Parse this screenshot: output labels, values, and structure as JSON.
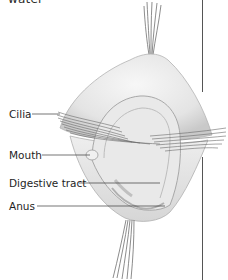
{
  "heading": {
    "text": "water"
  },
  "figure": {
    "colors": {
      "body_fill": "#ececec",
      "body_shade": "#cfcfcf",
      "outline": "#9a9a9a",
      "cilia": "#6e6e6e",
      "leader_line": "#3a3a3a",
      "divider": "#555555",
      "gut_mark": "#b5b5b5"
    }
  },
  "labels": [
    {
      "id": "cilia",
      "text": "Cilia"
    },
    {
      "id": "mouth",
      "text": "Mouth"
    },
    {
      "id": "digestive_tract",
      "text": "Digestive tract"
    },
    {
      "id": "anus",
      "text": "Anus"
    }
  ]
}
